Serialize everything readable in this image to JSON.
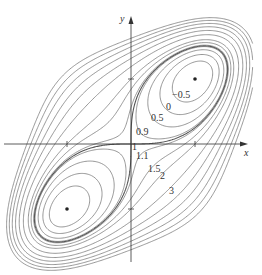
{
  "chart_data": {
    "type": "contour",
    "function": "f(x,y) = x^4 + y^4 - 4xy + 1",
    "title": "",
    "xlabel": "x",
    "ylabel": "y",
    "levels": [
      -0.5,
      0,
      0.5,
      0.9,
      1,
      1.1,
      1.5,
      2,
      3
    ],
    "level_labels": [
      "−0.5",
      "0",
      "0.5",
      "0.9",
      "1",
      "1.1",
      "1.5",
      "2",
      "3"
    ],
    "critical_points": [
      {
        "x": 1,
        "y": 1,
        "type": "local minimum",
        "marked": true
      },
      {
        "x": -1,
        "y": -1,
        "type": "local minimum",
        "marked": true
      },
      {
        "x": 0,
        "y": 0,
        "type": "saddle",
        "marked": false
      }
    ],
    "extra_outer_levels": [
      4,
      5,
      6,
      7,
      8
    ],
    "xlim": [
      -2.05,
      1.9
    ],
    "ylim": [
      -2.05,
      2.0
    ],
    "grid": false,
    "ticks": {
      "x": [
        -1,
        1
      ],
      "y": [
        -1,
        1
      ]
    },
    "colors": {
      "contour": "#6a6a6a",
      "axis": "#333333",
      "text": "#333333",
      "background": "#ffffff"
    }
  },
  "axes": {
    "x_label": "x",
    "y_label": "y"
  },
  "labels": [
    {
      "text": "−0.5",
      "px": 172,
      "py": 98
    },
    {
      "text": "0",
      "px": 166,
      "py": 110
    },
    {
      "text": "0.5",
      "px": 151,
      "py": 121
    },
    {
      "text": "0.9",
      "px": 136,
      "py": 135
    },
    {
      "text": "1",
      "px": 132,
      "py": 150
    },
    {
      "text": "1.1",
      "px": 136,
      "py": 159
    },
    {
      "text": "1.5",
      "px": 148,
      "py": 172
    },
    {
      "text": "2",
      "px": 160,
      "py": 179
    },
    {
      "text": "3",
      "px": 169,
      "py": 194
    }
  ]
}
